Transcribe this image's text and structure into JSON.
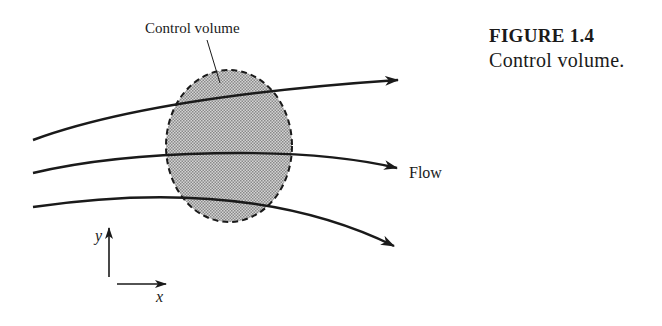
{
  "figure": {
    "number": "FIGURE 1.4",
    "caption": "Control volume."
  },
  "diagram": {
    "control_volume_label": "Control volume",
    "flow_label": "Flow",
    "axis_x_label": "x",
    "axis_y_label": "y",
    "streamline_count": 3,
    "colors": {
      "ink": "#1a1a1a",
      "control_volume_fill": "#b8b8b8",
      "background": "#ffffff"
    }
  }
}
